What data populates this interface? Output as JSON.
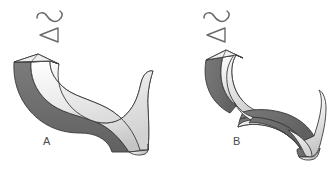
{
  "page": {
    "background_color": "#ffffff",
    "width": 329,
    "height": 172
  },
  "palette": {
    "outline": "#3a3a3a",
    "dark_face": "#6f6f6f",
    "dark_face_shadow": "#5c5c5c",
    "light_face_high": "#ffffff",
    "light_face_low": "#c8c8c8",
    "mid_face": "#d9d9d9",
    "label_color": "#4a4a4a",
    "symbol_color": "#6a6a6a"
  },
  "figures": [
    {
      "id": "A",
      "label": "A",
      "description": "S-curved extruded ribbon, untwisted",
      "symbol": {
        "name": "s-curve-and-left-triangle",
        "parts": [
          "s-curve",
          "left-pointing-triangle"
        ]
      }
    },
    {
      "id": "B",
      "label": "B",
      "description": "S-curved ribbon with a twist in the middle",
      "symbol": {
        "name": "s-curve-and-left-triangle",
        "parts": [
          "s-curve",
          "left-pointing-triangle"
        ]
      }
    }
  ]
}
